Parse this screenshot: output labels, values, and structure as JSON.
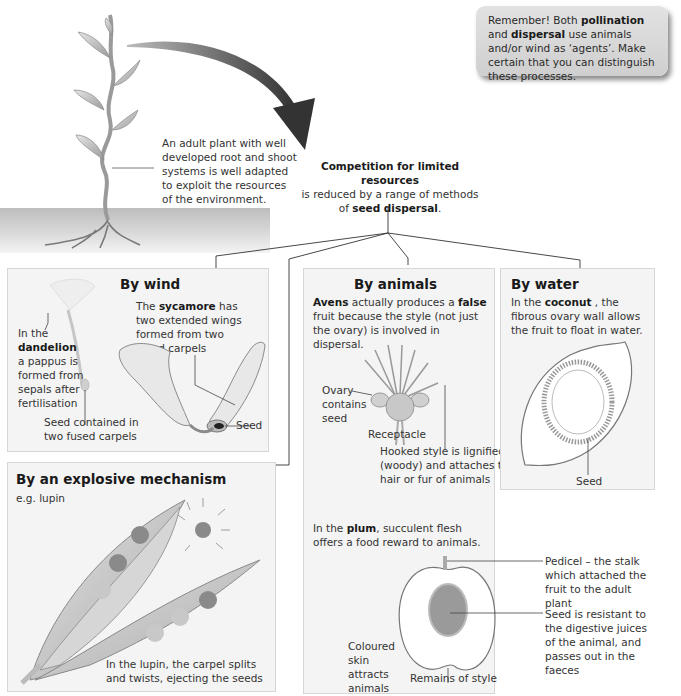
{
  "remember_box": {
    "prefix": "Remember! Both ",
    "bold1": "pollination",
    "mid": " and ",
    "bold2": "dispersal",
    "suffix": " use animals and/or wind as ‘agents’. Make certain that you can distinguish these processes."
  },
  "adult_plant": {
    "label": "An adult plant with well developed root and shoot systems is well adapted to exploit the resources of the environment."
  },
  "central_statement": {
    "bold_line": "Competition for limited resources",
    "line2": "is reduced by a range of methods",
    "line3_prefix": "of ",
    "line3_bold": "seed dispersal",
    "line3_suffix": "."
  },
  "panels": {
    "wind": {
      "title": "By wind",
      "dandelion_prefix": "In the",
      "dandelion_bold": "dandelion",
      "dandelion_rest": "a pappus is formed from sepals after fertilisation",
      "dandelion_seed": "Seed contained in two fused carpels",
      "sycamore_prefix": "The ",
      "sycamore_bold": "sycamore",
      "sycamore_rest": " has two extended wings formed from two fused carpels",
      "sycamore_seed": "Seed"
    },
    "animals": {
      "title": "By animals",
      "avens_bold": "Avens",
      "avens_mid": " actually produces a ",
      "avens_bold2": "false",
      "avens_rest": " fruit because the style (not just the ovary) is involved in dispersal.",
      "ovary_label": "Ovary contains seed",
      "receptacle_label": "Receptacle",
      "hooked_label": "Hooked style is lignified (woody) and attaches to hair or fur of animals",
      "plum_prefix": "In the ",
      "plum_bold": "plum",
      "plum_rest": ", succulent flesh offers a food reward to animals.",
      "pedicel_label": "Pedicel – the stalk which attached the fruit to the adult plant",
      "seed_resistant_label": "Seed is resistant to the digestive juices of the animal, and passes out in the faeces",
      "skin_label": "Coloured skin attracts animals",
      "style_label": "Remains of style"
    },
    "water": {
      "title": "By water",
      "coconut_prefix": "In the ",
      "coconut_bold": "coconut",
      "coconut_rest": " , the fibrous ovary wall allows the fruit to float in water.",
      "seed_label": "Seed"
    },
    "explosive": {
      "title": "By an explosive mechanism",
      "example": "e.g. lupin",
      "caption": "In the lupin, the carpel splits and twists, ejecting the seeds"
    }
  },
  "colors": {
    "panel_bg": "#f4f4f4",
    "panel_border": "#d6d6d6",
    "arrow": "#3a3a3a",
    "plant_fill": "#c8c8c8",
    "soil": "#d0d0d0"
  }
}
